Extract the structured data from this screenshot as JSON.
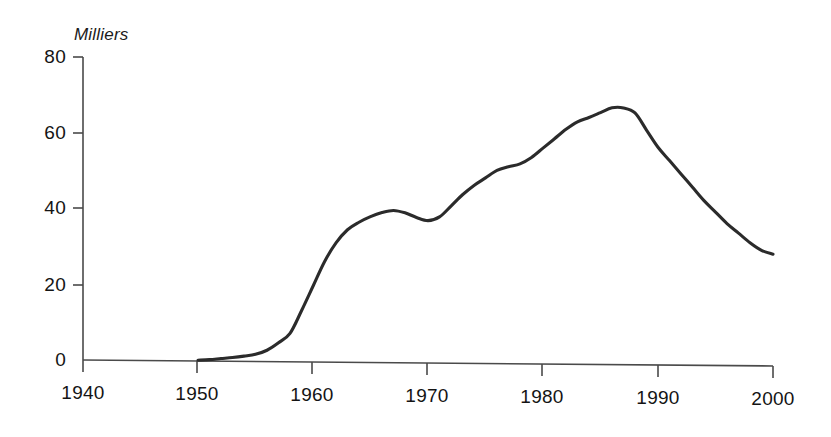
{
  "chart_data": {
    "type": "line",
    "title": "",
    "subtitle": "",
    "ylabel": "Milliers",
    "xlabel": "",
    "xlim": [
      1940,
      2000
    ],
    "ylim": [
      0,
      80
    ],
    "grid": false,
    "legend": false,
    "legend_position": "none",
    "series_color": "#2b2b2b",
    "axis_color": "#4a4a4a",
    "yticks": [
      "80",
      "60",
      "40",
      "20",
      "0"
    ],
    "ytick_values": [
      80,
      60,
      40,
      20,
      0
    ],
    "xticks": [
      "1940",
      "1950",
      "1960",
      "1970",
      "1980",
      "1990",
      "2000"
    ],
    "xtick_values": [
      1940,
      1950,
      1960,
      1970,
      1980,
      1990,
      2000
    ],
    "annotations": [],
    "series": [
      {
        "name": "Milliers",
        "x": [
          1950,
          1951,
          1952,
          1953,
          1954,
          1955,
          1956,
          1957,
          1958,
          1959,
          1960,
          1961,
          1962,
          1963,
          1964,
          1965,
          1966,
          1967,
          1968,
          1969,
          1970,
          1971,
          1972,
          1973,
          1974,
          1975,
          1976,
          1977,
          1978,
          1979,
          1980,
          1981,
          1982,
          1983,
          1984,
          1985,
          1986,
          1987,
          1988,
          1989,
          1990,
          1991,
          1992,
          1993,
          1994,
          1995,
          1996,
          1997,
          1998,
          1999,
          2000
        ],
        "values": [
          0.2,
          0.4,
          0.7,
          1.0,
          1.4,
          1.9,
          3.0,
          5.0,
          7.5,
          13.5,
          20.0,
          26.5,
          31.5,
          35.0,
          37.0,
          38.5,
          39.6,
          40.2,
          39.6,
          38.4,
          37.6,
          38.6,
          41.5,
          44.5,
          47.0,
          49.0,
          51.0,
          52.0,
          52.8,
          54.5,
          57.0,
          59.5,
          62.0,
          64.0,
          65.2,
          66.5,
          67.8,
          67.8,
          66.5,
          62.0,
          57.5,
          54.0,
          50.5,
          47.0,
          43.5,
          40.5,
          37.5,
          35.0,
          32.5,
          30.5,
          29.5
        ]
      }
    ]
  },
  "yaxis_title": "Milliers"
}
